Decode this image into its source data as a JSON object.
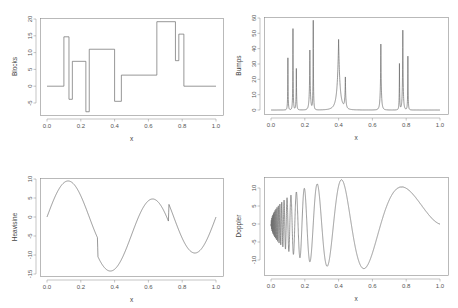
{
  "figure": {
    "width": 458,
    "height": 308,
    "line_color": "#6b6b6b",
    "frame_color": "#8a8a8a",
    "text_color": "#555555",
    "background": "#ffffff"
  },
  "chart_data": [
    {
      "id": "blocks",
      "type": "line",
      "step": true,
      "title": "",
      "xlabel": "x",
      "ylabel": "Blocks",
      "xlim": [
        0.0,
        1.0
      ],
      "ylim": [
        -8.8,
        20.0
      ],
      "xticks": [
        0.0,
        0.2,
        0.4,
        0.6,
        0.8,
        1.0
      ],
      "xtick_labels": [
        "0.0",
        "0.2",
        "0.4",
        "0.6",
        "0.8",
        "1.0"
      ],
      "yticks": [
        -5,
        0,
        5,
        10,
        15,
        20
      ],
      "ytick_labels": [
        "-5",
        "0",
        "5",
        "10",
        "15",
        "20"
      ],
      "grid": false,
      "panel": {
        "left": 40,
        "top": 18,
        "right": 223,
        "bottom": 115,
        "x0px": 47,
        "x1px": 216,
        "y_top_val": 20,
        "y_top_px": 19,
        "y_bot_val": -5,
        "y_bot_px": 103
      },
      "segments": [
        {
          "x0": 0.0,
          "x1": 0.1,
          "y": 0.0
        },
        {
          "x0": 0.1,
          "x1": 0.13,
          "y": 14.7
        },
        {
          "x0": 0.13,
          "x1": 0.15,
          "y": -3.9
        },
        {
          "x0": 0.15,
          "x1": 0.23,
          "y": 7.4
        },
        {
          "x0": 0.23,
          "x1": 0.25,
          "y": -7.6
        },
        {
          "x0": 0.25,
          "x1": 0.4,
          "y": 11.0
        },
        {
          "x0": 0.4,
          "x1": 0.44,
          "y": -4.5
        },
        {
          "x0": 0.44,
          "x1": 0.65,
          "y": 3.3
        },
        {
          "x0": 0.65,
          "x1": 0.76,
          "y": 19.2
        },
        {
          "x0": 0.76,
          "x1": 0.78,
          "y": 7.6
        },
        {
          "x0": 0.78,
          "x1": 0.81,
          "y": 15.5
        },
        {
          "x0": 0.81,
          "x1": 1.0,
          "y": 0.0
        }
      ]
    },
    {
      "id": "bumps",
      "type": "line",
      "title": "",
      "xlabel": "x",
      "ylabel": "Bumps",
      "xlim": [
        0.0,
        1.0
      ],
      "ylim": [
        -2.6,
        60.0
      ],
      "xticks": [
        0.0,
        0.2,
        0.4,
        0.6,
        0.8,
        1.0
      ],
      "xtick_labels": [
        "0.0",
        "0.2",
        "0.4",
        "0.6",
        "0.8",
        "1.0"
      ],
      "yticks": [
        0,
        10,
        20,
        30,
        40,
        50,
        60
      ],
      "ytick_labels": [
        "0",
        "10",
        "20",
        "30",
        "40",
        "50",
        "60"
      ],
      "grid": false,
      "panel": {
        "left": 264,
        "top": 17,
        "right": 448,
        "bottom": 114,
        "x0px": 271,
        "x1px": 440,
        "y_top_val": 60,
        "y_top_px": 18,
        "y_bot_val": 0,
        "y_bot_px": 110
      },
      "peaks": [
        {
          "x": 0.1,
          "height": 34,
          "width": 0.005
        },
        {
          "x": 0.13,
          "height": 53,
          "width": 0.005
        },
        {
          "x": 0.15,
          "height": 27,
          "width": 0.006
        },
        {
          "x": 0.23,
          "height": 39,
          "width": 0.01
        },
        {
          "x": 0.25,
          "height": 58,
          "width": 0.005
        },
        {
          "x": 0.4,
          "height": 46,
          "width": 0.03
        },
        {
          "x": 0.44,
          "height": 20,
          "width": 0.01
        },
        {
          "x": 0.65,
          "height": 43,
          "width": 0.01
        },
        {
          "x": 0.76,
          "height": 30,
          "width": 0.005
        },
        {
          "x": 0.78,
          "height": 52,
          "width": 0.008
        },
        {
          "x": 0.81,
          "height": 35,
          "width": 0.005
        }
      ]
    },
    {
      "id": "heavisine",
      "type": "line",
      "title": "",
      "xlabel": "x",
      "ylabel": "Heavisine",
      "xlim": [
        0.0,
        1.0
      ],
      "ylim": [
        -15.2,
        10.0
      ],
      "xticks": [
        0.0,
        0.2,
        0.4,
        0.6,
        0.8,
        1.0
      ],
      "xtick_labels": [
        "0.0",
        "0.2",
        "0.4",
        "0.6",
        "0.8",
        "1.0"
      ],
      "yticks": [
        -15,
        -10,
        -5,
        0,
        5,
        10
      ],
      "ytick_labels": [
        "-15",
        "-10",
        "-5",
        "0",
        "5",
        "10"
      ],
      "grid": false,
      "panel": {
        "left": 40,
        "top": 178,
        "right": 223,
        "bottom": 276,
        "x0px": 47,
        "x1px": 216,
        "y_top_val": 10,
        "y_top_px": 179,
        "y_bot_val": -15,
        "y_bot_px": 274
      },
      "formula": {
        "amp": 4,
        "freq": 4,
        "jump1": 0.3,
        "jump2": 0.72,
        "scale": 2.37
      },
      "samples": {
        "x": [
          0.0,
          0.05,
          0.1,
          0.13,
          0.2,
          0.25,
          0.3,
          0.301,
          0.37,
          0.45,
          0.55,
          0.62,
          0.7,
          0.72,
          0.721,
          0.8,
          0.88,
          0.95,
          1.0
        ],
        "y": [
          0.0,
          5.6,
          9.0,
          9.5,
          5.6,
          0.0,
          -5.6,
          -10.3,
          -14.2,
          -10.3,
          0.0,
          4.7,
          1.0,
          -0.9,
          3.7,
          -5.6,
          -9.3,
          -5.6,
          0.0
        ]
      }
    },
    {
      "id": "doppler",
      "type": "line",
      "title": "",
      "xlabel": "x",
      "ylabel": "Doppler",
      "xlim": [
        0.0,
        1.0
      ],
      "ylim": [
        -14.0,
        13.0
      ],
      "xticks": [
        0.0,
        0.2,
        0.4,
        0.6,
        0.8,
        1.0
      ],
      "xtick_labels": [
        "0.0",
        "0.2",
        "0.4",
        "0.6",
        "0.8",
        "1.0"
      ],
      "yticks": [
        -10,
        -5,
        0,
        5,
        10
      ],
      "ytick_labels": [
        "-10",
        "-5",
        "0",
        "5",
        "10"
      ],
      "grid": false,
      "panel": {
        "left": 264,
        "top": 177,
        "right": 448,
        "bottom": 275,
        "x0px": 271,
        "x1px": 440,
        "y_top_val": 10,
        "y_top_px": 188,
        "y_bot_val": -10,
        "y_bot_px": 260
      },
      "formula": {
        "eps": 0.05,
        "cycles": 2.1,
        "scale": 24.9
      },
      "samples": {
        "x": [
          0.0,
          0.17,
          0.2,
          0.24,
          0.3,
          0.37,
          0.49,
          0.7,
          0.96,
          1.0
        ],
        "y": [
          0.0,
          9.3,
          -10.0,
          10.6,
          -11.4,
          12.0,
          -12.4,
          11.3,
          -1.8,
          0.0
        ]
      }
    }
  ]
}
